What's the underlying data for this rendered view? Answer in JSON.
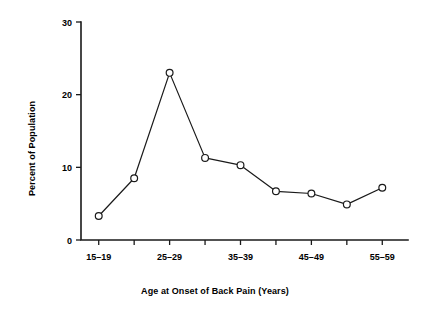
{
  "chart_data": {
    "type": "line",
    "title": "",
    "xlabel": "Age at Onset of Back Pain (Years)",
    "ylabel": "Percent of Population",
    "categories": [
      "15–19",
      "20–24",
      "25–29",
      "30–34",
      "35–39",
      "40–44",
      "45–49",
      "50–54",
      "55–59"
    ],
    "tick_labels_shown": [
      "15–19",
      "",
      "25–29",
      "",
      "35–39",
      "",
      "45–49",
      "",
      "55–59"
    ],
    "values": [
      3.3,
      8.5,
      23.0,
      11.3,
      10.3,
      6.7,
      6.4,
      4.9,
      7.2
    ],
    "ylim": [
      0,
      30
    ],
    "y_ticks": [
      0,
      10,
      20,
      30
    ],
    "y_tick_labels": [
      "0",
      "10",
      "20",
      "30"
    ],
    "grid": false,
    "legend": false,
    "marker": "open-circle",
    "line_color": "#1a1a1a",
    "marker_fill": "#ffffff",
    "background": "#ffffff"
  },
  "axes": {
    "y_title": "Percent of Population",
    "x_title": "Age at Onset of Back Pain (Years)"
  }
}
